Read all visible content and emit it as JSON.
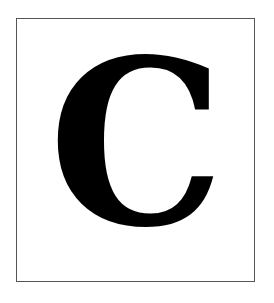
{
  "card": {
    "letter": "C",
    "letter_color": "#000000",
    "border_color": "#555555",
    "background": "#ffffff"
  }
}
